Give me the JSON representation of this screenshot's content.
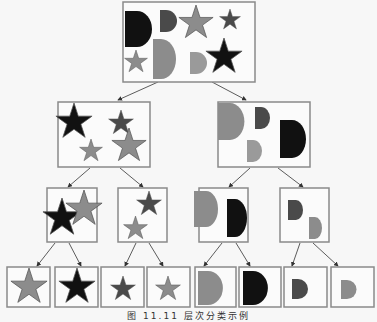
{
  "caption": "图 11.11 层次分类示例",
  "colors": {
    "black": "#111111",
    "dark": "#4a4a4a",
    "mid": "#8c8c8c",
    "light": "#9a9a9a",
    "border": "#8a8a8a",
    "edge": "#333333"
  },
  "tree": {
    "root": {
      "label": "all shapes",
      "shapes": [
        "D-black",
        "D-dark",
        "star-mid",
        "star-dark",
        "star-mid-small",
        "D-mid-large",
        "D-light",
        "star-black"
      ]
    },
    "level1": [
      {
        "label": "stars",
        "shapes": [
          "star-black",
          "star-dark",
          "star-mid-small",
          "star-mid-large"
        ]
      },
      {
        "label": "D-shapes",
        "shapes": [
          "D-mid-large",
          "D-dark",
          "D-light",
          "D-black"
        ]
      }
    ],
    "level2": [
      {
        "label": "large stars",
        "shapes": [
          "star-black",
          "star-mid"
        ]
      },
      {
        "label": "small stars",
        "shapes": [
          "star-dark",
          "star-mid"
        ]
      },
      {
        "label": "large D-shapes",
        "shapes": [
          "D-mid",
          "D-black"
        ]
      },
      {
        "label": "small D-shapes",
        "shapes": [
          "D-dark",
          "D-mid"
        ]
      }
    ],
    "leaves": [
      "star-mid-large",
      "star-black-large",
      "star-dark-small",
      "star-mid-small",
      "D-mid-large",
      "D-black-large",
      "D-dark-small",
      "D-mid-small"
    ]
  }
}
